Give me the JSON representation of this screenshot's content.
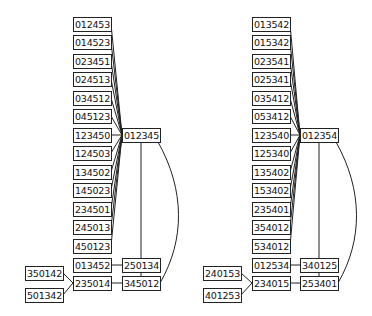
{
  "diagrams": [
    {
      "name": "left",
      "hub": "012345",
      "leaves": [
        "012453",
        "014523",
        "023451",
        "024513",
        "034512",
        "045123",
        "123450",
        "124503",
        "134502",
        "145023",
        "234501",
        "245013",
        "450123"
      ],
      "lower_left": "013452",
      "lower_right_top": "250134",
      "bottom_left": "235014",
      "bottom_right": "345012",
      "far_left_top": "350142",
      "far_left_bottom": "501342"
    },
    {
      "name": "right",
      "hub": "012354",
      "leaves": [
        "013542",
        "015342",
        "023541",
        "025341",
        "035412",
        "053412",
        "123540",
        "125340",
        "135402",
        "153402",
        "235401",
        "354012",
        "534012"
      ],
      "lower_left": "012534",
      "lower_right_top": "340125",
      "bottom_left": "234015",
      "bottom_right": "253401",
      "far_left_top": "240153",
      "far_left_bottom": "401253"
    }
  ],
  "colors": {
    "line": "#222222",
    "box_border": "#222222",
    "background": "#ffffff"
  }
}
